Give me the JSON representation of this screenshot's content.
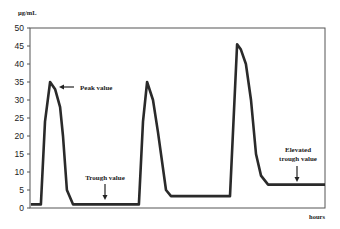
{
  "chart_data": {
    "type": "line",
    "title": "",
    "xlabel": "hours",
    "ylabel": "µg/mL",
    "xlim": [
      0,
      100
    ],
    "ylim": [
      0,
      50
    ],
    "y_ticks": [
      0,
      5,
      10,
      15,
      20,
      25,
      30,
      35,
      40,
      45,
      50
    ],
    "x_ticks": [],
    "grid": false,
    "legend": "none",
    "series": [
      {
        "name": "concentration",
        "color": "#2a2a2a",
        "x": [
          0.3,
          3.7,
          5.1,
          6.8,
          8.5,
          10.2,
          11.2,
          12.5,
          14.6,
          36.9,
          38.3,
          39.7,
          41.7,
          43.4,
          46.1,
          47.8,
          67.8,
          70.2,
          71.5,
          73.2,
          74.9,
          76.6,
          78.3,
          80.7,
          100
        ],
        "y": [
          1,
          1,
          24,
          35,
          33,
          28,
          20,
          5,
          1,
          1,
          24,
          35,
          30,
          21,
          5,
          3.3,
          3.3,
          45.5,
          44,
          40,
          30,
          15,
          9,
          6.5,
          6.5
        ]
      }
    ],
    "annotations": [
      {
        "text": "Peak value",
        "target_x": 6.8,
        "target_y": 35,
        "arrow": "left"
      },
      {
        "text": "Trough value",
        "target_x": 25,
        "target_y": 1,
        "arrow": "down"
      },
      {
        "text_lines": [
          "Elevated",
          "trough value"
        ],
        "target_x": 90.5,
        "target_y": 6.5,
        "arrow": "down"
      }
    ]
  }
}
